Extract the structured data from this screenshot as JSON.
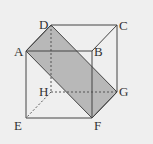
{
  "figure": {
    "type": "cube-with-shaded-section",
    "background": "#efefef",
    "edge_color": "#444444",
    "shade_color": "#b8b8b8",
    "vertices": {
      "A": {
        "label": "A",
        "x": 26,
        "y": 51
      },
      "B": {
        "label": "B",
        "x": 92,
        "y": 51
      },
      "C": {
        "label": "C",
        "x": 117,
        "y": 25
      },
      "D": {
        "label": "D",
        "x": 51,
        "y": 25
      },
      "E": {
        "label": "E",
        "x": 26,
        "y": 118
      },
      "F": {
        "label": "F",
        "x": 92,
        "y": 118
      },
      "G": {
        "label": "G",
        "x": 117,
        "y": 92
      },
      "H": {
        "label": "H",
        "x": 51,
        "y": 92
      }
    },
    "shaded_section": [
      "A",
      "D",
      "G",
      "F"
    ],
    "hidden_edges": [
      "D-H",
      "H-E",
      "H-G"
    ],
    "visible_edges": [
      "A-B",
      "B-C",
      "C-D",
      "D-A",
      "A-E",
      "B-F",
      "C-G",
      "E-F",
      "F-G"
    ]
  }
}
